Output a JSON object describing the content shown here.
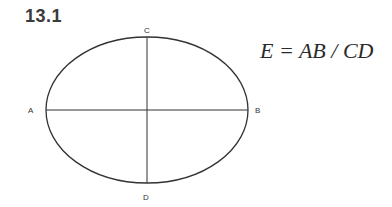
{
  "figure": {
    "number": "13.1",
    "formula": "E = AB / CD",
    "labels": {
      "a": "A",
      "b": "B",
      "c": "C",
      "d": "D"
    },
    "ellipse": {
      "cx": 147,
      "cy": 110,
      "rx": 101,
      "ry": 73
    },
    "stroke_color": "#333333"
  }
}
